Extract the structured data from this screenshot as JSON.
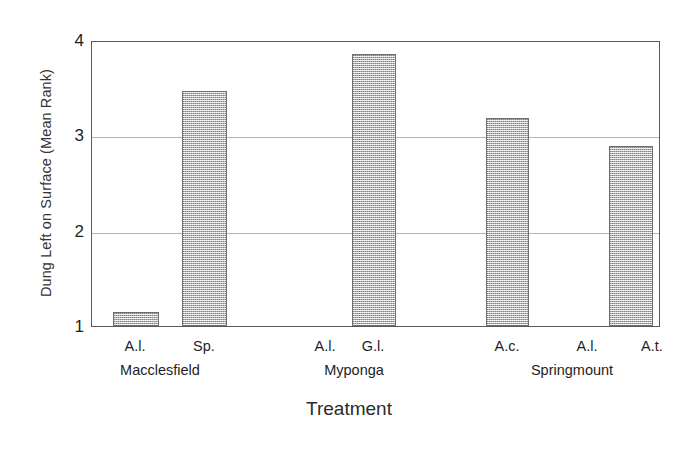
{
  "chart_data": {
    "type": "bar",
    "title": "",
    "xlabel": "Treatment",
    "ylabel": "Dung Left on Surface (Mean Rank)",
    "ylim": [
      1,
      4
    ],
    "yticks": [
      1,
      2,
      3,
      4
    ],
    "ytick_labels": [
      "1",
      "2",
      "3",
      "4"
    ],
    "gridlines": [
      2,
      3
    ],
    "grid": true,
    "legend": "none",
    "categories": [
      "A.l.",
      "Sp.",
      "A.l.",
      "G.l.",
      "A.c.",
      "A.l.",
      "A.t."
    ],
    "groups": [
      {
        "label": "Macclesfield",
        "categories": [
          "A.l.",
          "Sp."
        ]
      },
      {
        "label": "Myponga",
        "categories": [
          "A.l.",
          "G.l."
        ]
      },
      {
        "label": "Springmount",
        "categories": [
          "A.c.",
          "A.l.",
          "A.t."
        ]
      }
    ],
    "values": [
      1.15,
      3.47,
      1.0,
      3.85,
      3.18,
      1.0,
      2.89
    ],
    "bars": [
      {
        "category": "A.l.",
        "group": "Macclesfield",
        "value": 1.15
      },
      {
        "category": "Sp.",
        "group": "Macclesfield",
        "value": 3.47
      },
      {
        "category": "A.l.",
        "group": "Myponga",
        "value": 1.0
      },
      {
        "category": "G.l.",
        "group": "Myponga",
        "value": 3.85
      },
      {
        "category": "A.c.",
        "group": "Springmount",
        "value": 3.18
      },
      {
        "category": "A.l.",
        "group": "Springmount",
        "value": 1.0
      },
      {
        "category": "A.t.",
        "group": "Springmount",
        "value": 2.89
      }
    ],
    "bar_fill_color": "#b0b0b0",
    "bar_edge_color": "#6e6e6e",
    "axis_color": "#5a5a5a",
    "grid_color": "#b5b5b5"
  }
}
